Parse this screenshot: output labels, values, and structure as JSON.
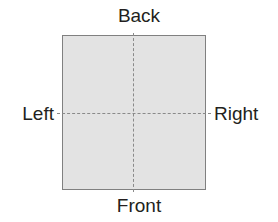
{
  "diagram": {
    "type": "orientation-plate",
    "plate": {
      "fill_color": "#e3e3e3",
      "border_color": "#808080"
    },
    "axes": {
      "line_color": "#8a8a8a",
      "style": "dashed"
    },
    "labels": {
      "top": "Back",
      "bottom": "Front",
      "left": "Left",
      "right": "Right"
    },
    "text_color": "#231f20",
    "background_color": "#ffffff"
  }
}
